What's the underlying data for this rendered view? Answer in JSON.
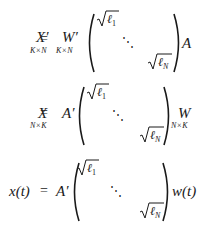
{
  "equations": [
    {
      "lhs": {
        "symbol": "X′",
        "subscript": "K×N"
      },
      "equals": "=",
      "left_factor": {
        "symbol": "W′",
        "subscript": "K×N"
      },
      "matrix": {
        "top_left": "ℓ1",
        "top_left_sub": "1",
        "dots": "⋱",
        "bottom_right": "ℓN",
        "bottom_right_sub": "N"
      },
      "right_factor": {
        "symbol": "A",
        "subscript": ""
      }
    },
    {
      "lhs": {
        "symbol": "X",
        "subscript": "N×K"
      },
      "equals": "=",
      "left_factor": {
        "symbol": "A′",
        "subscript": ""
      },
      "matrix": {
        "top_left": "ℓ1",
        "top_left_sub": "1",
        "dots": "⋱",
        "bottom_right": "ℓN",
        "bottom_right_sub": "N"
      },
      "right_factor": {
        "symbol": "W",
        "subscript": "N×K"
      }
    },
    {
      "lhs": {
        "symbol": "x(t)",
        "subscript": ""
      },
      "equals": "=",
      "left_factor": {
        "symbol": "A′",
        "subscript": ""
      },
      "matrix": {
        "top_left": "ℓ1",
        "top_left_sub": "1",
        "dots": "⋱",
        "bottom_right": "ℓN",
        "bottom_right_sub": "N"
      },
      "right_factor": {
        "symbol": "w(t)",
        "subscript": ""
      }
    }
  ]
}
